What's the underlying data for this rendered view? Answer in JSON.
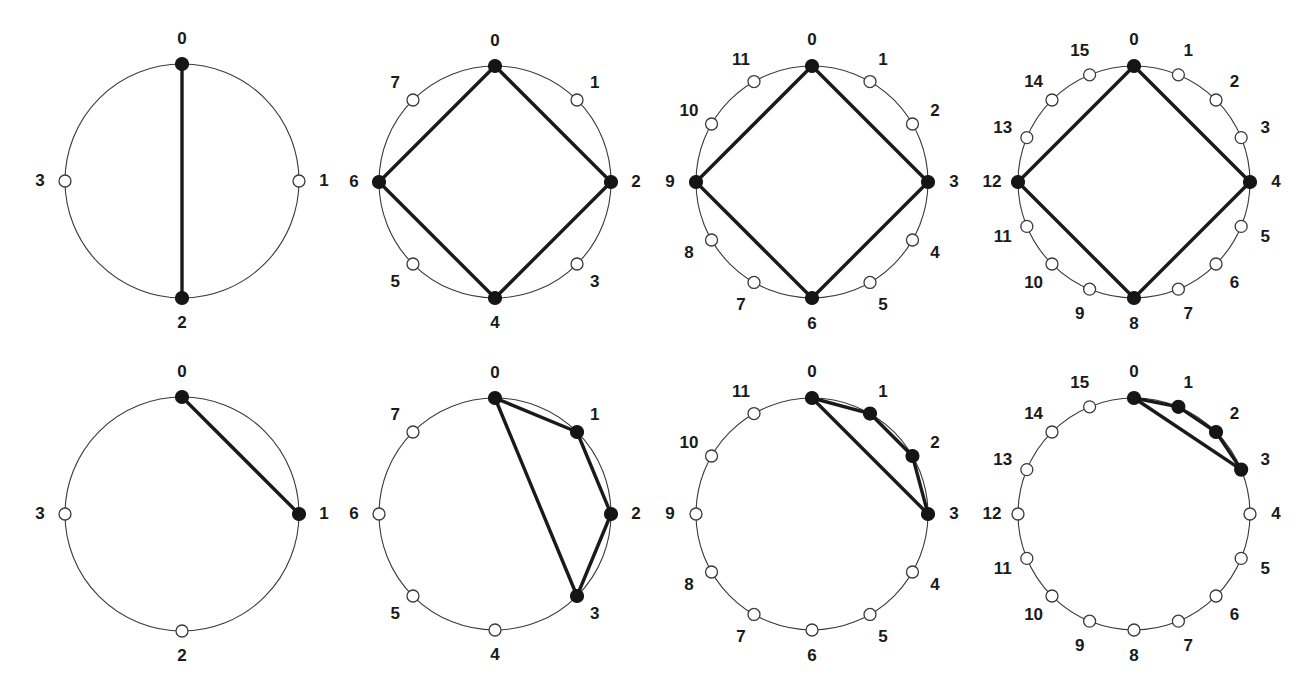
{
  "figure": {
    "background_color": "#ffffff",
    "rows": 2,
    "columns": 4,
    "node_colors": {
      "filled": "#151515",
      "open_fill": "#ffffff",
      "open_stroke": "#3a3a3a",
      "rim": "#3a3a3a",
      "edge": "#1a1a1a",
      "label": "#1a1a1a"
    }
  },
  "chart_data": {
    "type": "diagram",
    "panels": [
      {
        "id": "top-1",
        "row": 0,
        "col": 0,
        "n_nodes": 4,
        "labels": [
          "0",
          "1",
          "2",
          "3"
        ],
        "filled_nodes": [
          0,
          2
        ],
        "edges": [
          [
            0,
            2
          ]
        ],
        "center": [
          182,
          181
        ],
        "radius": 117,
        "label_radius": 142
      },
      {
        "id": "top-2",
        "row": 0,
        "col": 1,
        "n_nodes": 8,
        "labels": [
          "0",
          "1",
          "2",
          "3",
          "4",
          "5",
          "6",
          "7"
        ],
        "filled_nodes": [
          0,
          2,
          4,
          6
        ],
        "edges": [
          [
            0,
            2
          ],
          [
            2,
            4
          ],
          [
            4,
            6
          ],
          [
            6,
            0
          ]
        ],
        "center": [
          495,
          182
        ],
        "radius": 116,
        "label_radius": 141
      },
      {
        "id": "top-3",
        "row": 0,
        "col": 2,
        "n_nodes": 12,
        "labels": [
          "0",
          "1",
          "2",
          "3",
          "4",
          "5",
          "6",
          "7",
          "8",
          "9",
          "10",
          "11"
        ],
        "filled_nodes": [
          0,
          3,
          6,
          9
        ],
        "edges": [
          [
            0,
            3
          ],
          [
            3,
            6
          ],
          [
            6,
            9
          ],
          [
            9,
            0
          ]
        ],
        "center": [
          812,
          182
        ],
        "radius": 116,
        "label_radius": 142
      },
      {
        "id": "top-4",
        "row": 0,
        "col": 3,
        "n_nodes": 16,
        "labels": [
          "0",
          "1",
          "2",
          "3",
          "4",
          "5",
          "6",
          "7",
          "8",
          "9",
          "10",
          "11",
          "12",
          "13",
          "14",
          "15"
        ],
        "filled_nodes": [
          0,
          4,
          8,
          12
        ],
        "edges": [
          [
            0,
            4
          ],
          [
            4,
            8
          ],
          [
            8,
            12
          ],
          [
            12,
            0
          ]
        ],
        "center": [
          1134,
          182
        ],
        "radius": 116,
        "label_radius": 142
      },
      {
        "id": "bottom-1",
        "row": 1,
        "col": 0,
        "n_nodes": 4,
        "labels": [
          "0",
          "1",
          "2",
          "3"
        ],
        "filled_nodes": [
          0,
          1
        ],
        "edges": [
          [
            0,
            1
          ]
        ],
        "center": [
          182,
          514
        ],
        "radius": 117,
        "label_radius": 142
      },
      {
        "id": "bottom-2",
        "row": 1,
        "col": 1,
        "n_nodes": 8,
        "labels": [
          "0",
          "1",
          "2",
          "3",
          "4",
          "5",
          "6",
          "7"
        ],
        "filled_nodes": [
          0,
          1,
          2,
          3
        ],
        "edges": [
          [
            0,
            1
          ],
          [
            1,
            2
          ],
          [
            2,
            3
          ],
          [
            3,
            0
          ]
        ],
        "center": [
          495,
          514
        ],
        "radius": 116,
        "label_radius": 141
      },
      {
        "id": "bottom-3",
        "row": 1,
        "col": 2,
        "n_nodes": 12,
        "labels": [
          "0",
          "1",
          "2",
          "3",
          "4",
          "5",
          "6",
          "7",
          "8",
          "9",
          "10",
          "11"
        ],
        "filled_nodes": [
          0,
          1,
          2,
          3
        ],
        "edges": [
          [
            0,
            1
          ],
          [
            1,
            2
          ],
          [
            2,
            3
          ],
          [
            3,
            0
          ]
        ],
        "center": [
          812,
          514
        ],
        "radius": 116,
        "label_radius": 142
      },
      {
        "id": "bottom-4",
        "row": 1,
        "col": 3,
        "n_nodes": 16,
        "labels": [
          "0",
          "1",
          "2",
          "3",
          "4",
          "5",
          "6",
          "7",
          "8",
          "9",
          "10",
          "11",
          "12",
          "13",
          "14",
          "15"
        ],
        "filled_nodes": [
          0,
          1,
          2,
          3
        ],
        "edges": [
          [
            0,
            1
          ],
          [
            1,
            2
          ],
          [
            2,
            3
          ],
          [
            3,
            0
          ]
        ],
        "center": [
          1134,
          514
        ],
        "radius": 116,
        "label_radius": 142
      }
    ],
    "marker_radius_filled": 6.5,
    "marker_radius_open": 6.0,
    "start_angle_deg": 90,
    "direction": "clockwise"
  }
}
